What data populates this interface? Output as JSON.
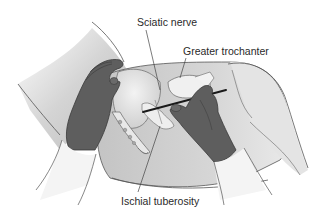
{
  "figure": {
    "labels": {
      "sciatic_nerve": "Sciatic nerve",
      "greater_trochanter": "Greater trochanter",
      "ischial_tuberosity": "Ischial tuberosity"
    },
    "colors": {
      "background": "#ffffff",
      "skin": "#c9c9c9",
      "skin_light": "#e6e6e6",
      "glove": "#5e5e5e",
      "glove_dark": "#474747",
      "bone": "#ececec",
      "outline": "#555555",
      "needle": "#1a1a1a",
      "sleeve": "#f4f4f4",
      "leader_line": "#444444"
    }
  }
}
